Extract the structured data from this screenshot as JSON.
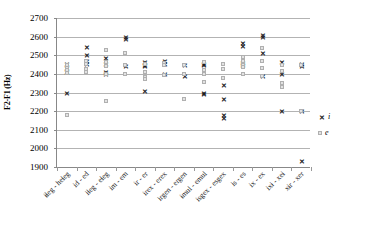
{
  "chart_data": {
    "type": "scatter",
    "title": "",
    "xlabel": "",
    "ylabel": "F2-F1 (Hz)",
    "ylim": [
      1900,
      2700
    ],
    "ytick_step": 100,
    "yticks": [
      2700,
      2600,
      2500,
      2400,
      2300,
      2200,
      2100,
      2000,
      1900
    ],
    "grid": true,
    "legend_position": "right",
    "categories": [
      "ɨɬeg - heɬeg",
      "id - ed",
      "iɬeg - eɬeg",
      "im - em",
      "ir - er",
      "irex - erex",
      "irgen - ergen",
      "ɨmul - emul",
      "isgex - esgex",
      "is - es",
      "ix - ex",
      "ixɨ - xeɨ",
      "xɨr - xer"
    ],
    "series": [
      {
        "name": "i",
        "marker": "x",
        "color": "#1a1a1a",
        "points": [
          {
            "cat": 0,
            "values": [
              2455,
              2430,
              2412,
              2298
            ]
          },
          {
            "cat": 1,
            "values": [
              2545,
              2500,
              2470,
              2452
            ]
          },
          {
            "cat": 2,
            "values": [
              2485,
              2455,
              2410,
              2402
            ]
          },
          {
            "cat": 3,
            "values": [
              2598,
              2588,
              2442
            ]
          },
          {
            "cat": 4,
            "values": [
              2462,
              2448,
              2443,
              2310
            ]
          },
          {
            "cat": 5,
            "values": [
              2470,
              2455,
              2400
            ]
          },
          {
            "cat": 6,
            "values": [
              2448,
              2390
            ]
          },
          {
            "cat": 7,
            "values": [
              2452,
              2448,
              2300,
              2290
            ]
          },
          {
            "cat": 8,
            "values": [
              2340,
              2265,
              2178,
              2163
            ]
          },
          {
            "cat": 9,
            "values": [
              2565,
              2548,
              2460,
              2448
            ]
          },
          {
            "cat": 10,
            "values": [
              2608,
              2598,
              2510,
              2390
            ]
          },
          {
            "cat": 11,
            "values": [
              2462,
              2400,
              2198
            ]
          },
          {
            "cat": 12,
            "values": [
              2452,
              2440,
              2198,
              1932
            ]
          }
        ]
      },
      {
        "name": "e",
        "marker": "square",
        "color": "#e2e2e2",
        "points": [
          {
            "cat": 0,
            "values": [
              2448,
              2432,
              2420,
              2405,
              2178
            ]
          },
          {
            "cat": 1,
            "values": [
              2470,
              2452,
              2425,
              2412
            ]
          },
          {
            "cat": 2,
            "values": [
              2530,
              2465,
              2440,
              2400,
              2253
            ]
          },
          {
            "cat": 3,
            "values": [
              2512,
              2448,
              2400
            ]
          },
          {
            "cat": 4,
            "values": [
              2455,
              2408,
              2385,
              2370
            ]
          },
          {
            "cat": 5,
            "values": [
              2460,
              2448,
              2395
            ]
          },
          {
            "cat": 6,
            "values": [
              2448,
              2400,
              2265
            ]
          },
          {
            "cat": 7,
            "values": [
              2465,
              2422,
              2400,
              2355
            ]
          },
          {
            "cat": 8,
            "values": [
              2455,
              2425,
              2378
            ]
          },
          {
            "cat": 9,
            "values": [
              2492,
              2470,
              2448,
              2438,
              2398
            ]
          },
          {
            "cat": 10,
            "values": [
              2538,
              2470,
              2432,
              2388
            ]
          },
          {
            "cat": 11,
            "values": [
              2448,
              2415,
              2350,
              2330
            ]
          },
          {
            "cat": 12,
            "values": [
              2448,
              2198
            ]
          }
        ]
      }
    ],
    "legend": [
      {
        "label": "i",
        "marker": "x"
      },
      {
        "label": "e",
        "marker": "square"
      }
    ]
  }
}
